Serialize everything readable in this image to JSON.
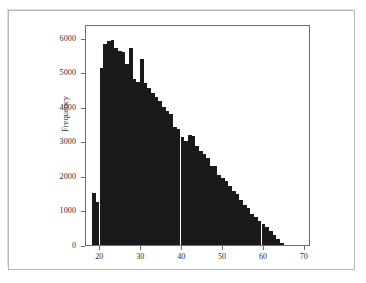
{
  "chart_data": {
    "type": "bar",
    "title": "",
    "subtitle": "",
    "xlabel": "",
    "ylabel": "Frequency",
    "xlim": [
      16.5,
      71.5
    ],
    "ylim": [
      0,
      6400
    ],
    "grid": false,
    "legend": null,
    "bar_color": "#1a1a1a",
    "frame_color": "#6e6e6e",
    "bin_width": 0.9,
    "xticks": [
      20,
      30,
      40,
      50,
      60,
      70
    ],
    "xtick_labels": [
      "20",
      "30",
      "40",
      "50",
      "60",
      "70"
    ],
    "yticks": [
      0,
      1000,
      2000,
      3000,
      4000,
      5000,
      6000
    ],
    "ytick_labels": [
      "0",
      "1000",
      "2000",
      "3000",
      "4000",
      "5000",
      "6000"
    ],
    "x": [
      18.0,
      18.9,
      19.8,
      20.7,
      21.6,
      22.5,
      23.4,
      24.3,
      25.2,
      26.1,
      27.0,
      27.9,
      28.8,
      29.7,
      30.6,
      31.5,
      32.4,
      33.3,
      34.2,
      35.1,
      36.0,
      36.9,
      37.8,
      38.7,
      39.6,
      40.5,
      41.4,
      42.3,
      43.2,
      44.1,
      45.0,
      45.9,
      46.8,
      47.7,
      48.6,
      49.5,
      50.4,
      51.3,
      52.2,
      53.1,
      54.0,
      54.9,
      55.8,
      56.7,
      57.6,
      58.5,
      59.4,
      60.3,
      61.2,
      62.1,
      63.0,
      63.9
    ],
    "values": [
      1520,
      1250,
      5120,
      5820,
      5900,
      5950,
      5700,
      5620,
      5600,
      5250,
      5700,
      4820,
      4720,
      5380,
      4700,
      4560,
      4400,
      4300,
      4180,
      4000,
      3870,
      3780,
      3420,
      3360,
      3120,
      3020,
      3200,
      3150,
      2880,
      2720,
      2640,
      2520,
      2300,
      2280,
      2020,
      1950,
      1840,
      1700,
      1560,
      1480,
      1300,
      1170,
      1080,
      900,
      820,
      700,
      620,
      520,
      420,
      300,
      180,
      60
    ]
  },
  "axes": {
    "y_title": "Frequency",
    "x_title": ""
  }
}
